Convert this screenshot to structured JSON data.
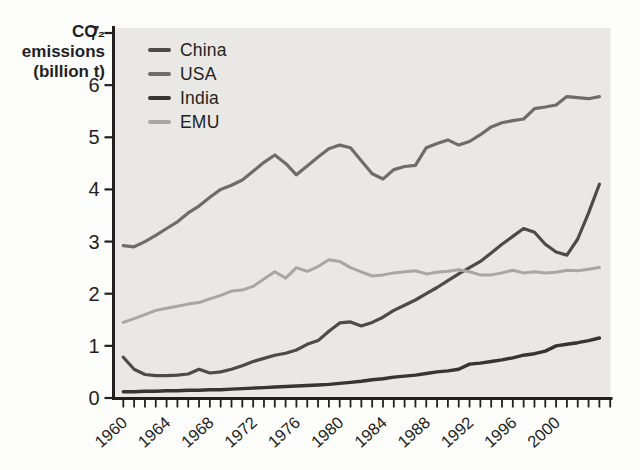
{
  "figure": {
    "y_axis_title": {
      "line1": "CO₂",
      "line2": "emissions",
      "line3": "(billion t)"
    }
  },
  "chart_data": {
    "type": "line",
    "title": "",
    "ylabel": "CO₂ emissions (billion t)",
    "xlabel": "",
    "grid": false,
    "legend_position": "top-left-inside",
    "plot_bg": "#e9e8e5",
    "axis_color": "#231f20",
    "ylim": [
      0,
      7
    ],
    "y_ticks": [
      0,
      1,
      2,
      3,
      4,
      5,
      6,
      7
    ],
    "x_axis_range": [
      1960,
      2005
    ],
    "x_major_ticks": [
      1960,
      1964,
      1968,
      1972,
      1976,
      1980,
      1984,
      1988,
      1992,
      1996,
      2000
    ],
    "x": [
      1960,
      1961,
      1962,
      1963,
      1964,
      1965,
      1966,
      1967,
      1968,
      1969,
      1970,
      1971,
      1972,
      1973,
      1974,
      1975,
      1976,
      1977,
      1978,
      1979,
      1980,
      1981,
      1982,
      1983,
      1984,
      1985,
      1986,
      1987,
      1988,
      1989,
      1990,
      1991,
      1992,
      1993,
      1994,
      1995,
      1996,
      1997,
      1998,
      1999,
      2000,
      2001,
      2002,
      2003,
      2004
    ],
    "series": [
      {
        "name": "China",
        "color": "#4e4a49",
        "width": 3.2,
        "values": [
          0.78,
          0.55,
          0.45,
          0.43,
          0.43,
          0.44,
          0.46,
          0.55,
          0.48,
          0.5,
          0.55,
          0.62,
          0.7,
          0.76,
          0.82,
          0.86,
          0.92,
          1.03,
          1.1,
          1.28,
          1.44,
          1.46,
          1.38,
          1.45,
          1.55,
          1.68,
          1.78,
          1.88,
          2.0,
          2.12,
          2.25,
          2.38,
          2.5,
          2.62,
          2.78,
          2.95,
          3.1,
          3.25,
          3.18,
          2.95,
          2.8,
          2.74,
          3.05,
          3.55,
          4.1
        ]
      },
      {
        "name": "USA",
        "color": "#6f6d6c",
        "width": 3.2,
        "values": [
          2.92,
          2.9,
          3.0,
          3.12,
          3.25,
          3.38,
          3.55,
          3.68,
          3.85,
          4.0,
          4.08,
          4.18,
          4.35,
          4.52,
          4.66,
          4.5,
          4.28,
          4.45,
          4.62,
          4.78,
          4.85,
          4.8,
          4.55,
          4.3,
          4.2,
          4.38,
          4.44,
          4.46,
          4.8,
          4.88,
          4.95,
          4.85,
          4.92,
          5.05,
          5.2,
          5.28,
          5.32,
          5.35,
          5.55,
          5.58,
          5.62,
          5.78,
          5.76,
          5.74,
          5.78
        ]
      },
      {
        "name": "India",
        "color": "#383433",
        "width": 3.4,
        "values": [
          0.12,
          0.12,
          0.13,
          0.13,
          0.14,
          0.14,
          0.15,
          0.15,
          0.16,
          0.16,
          0.17,
          0.18,
          0.19,
          0.2,
          0.21,
          0.22,
          0.23,
          0.24,
          0.25,
          0.26,
          0.28,
          0.3,
          0.32,
          0.35,
          0.37,
          0.4,
          0.42,
          0.44,
          0.47,
          0.5,
          0.52,
          0.55,
          0.65,
          0.67,
          0.7,
          0.73,
          0.77,
          0.82,
          0.85,
          0.9,
          1.0,
          1.03,
          1.06,
          1.1,
          1.15
        ]
      },
      {
        "name": "EMU",
        "color": "#a9a7a5",
        "width": 3.0,
        "values": [
          1.45,
          1.52,
          1.6,
          1.68,
          1.72,
          1.76,
          1.8,
          1.83,
          1.9,
          1.97,
          2.05,
          2.07,
          2.14,
          2.28,
          2.42,
          2.3,
          2.5,
          2.43,
          2.52,
          2.65,
          2.62,
          2.5,
          2.42,
          2.34,
          2.36,
          2.4,
          2.42,
          2.44,
          2.38,
          2.41,
          2.43,
          2.46,
          2.42,
          2.36,
          2.36,
          2.4,
          2.45,
          2.4,
          2.42,
          2.4,
          2.41,
          2.45,
          2.44,
          2.47,
          2.5
        ]
      }
    ]
  }
}
